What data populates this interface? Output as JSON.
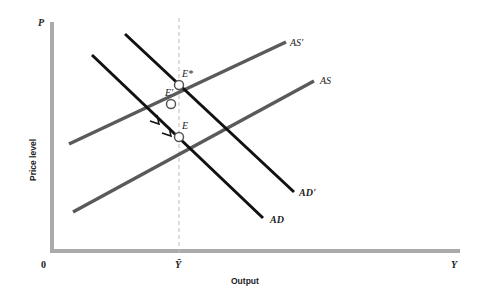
{
  "diagram": {
    "type": "economics-ad-as",
    "axes": {
      "y_symbol": "P",
      "x_symbol": "Y",
      "origin": "0",
      "y_title": "Price level",
      "x_title": "Output",
      "x_marker": "Ȳ",
      "axis_color": "#aaaaaa"
    },
    "curves": [
      {
        "name": "AS",
        "label": "AS",
        "color": "#5a5a5a"
      },
      {
        "name": "AS'",
        "label": "AS'",
        "color": "#5a5a5a"
      },
      {
        "name": "AD",
        "label": "AD",
        "color": "#111111"
      },
      {
        "name": "AD'",
        "label": "AD'",
        "color": "#111111"
      }
    ],
    "points": [
      {
        "name": "E",
        "label": "E"
      },
      {
        "name": "E'",
        "label": "E'"
      },
      {
        "name": "E*",
        "label": "E*"
      }
    ],
    "potential_output_line": "dashed vertical at Ȳ"
  }
}
